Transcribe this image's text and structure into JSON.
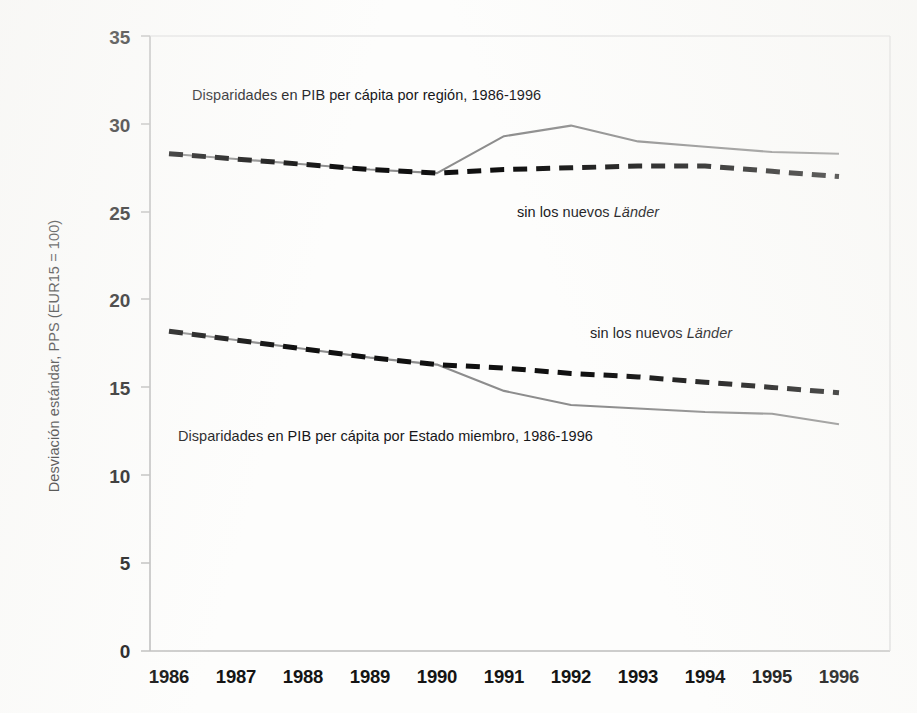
{
  "chart_data": {
    "type": "line",
    "title": "",
    "xlabel": "",
    "ylabel": "Desviación estándar, PPS (EUR15 = 100)",
    "x": [
      1986,
      1987,
      1988,
      1989,
      1990,
      1991,
      1992,
      1993,
      1994,
      1995,
      1996
    ],
    "xtick_labels": [
      "1986",
      "1987",
      "1988",
      "1989",
      "1990",
      "1991",
      "1992",
      "1993",
      "1994",
      "1995",
      "1996"
    ],
    "ytick_labels": [
      "0",
      "5",
      "10",
      "15",
      "20",
      "25",
      "30",
      "35"
    ],
    "yticks": [
      0,
      5,
      10,
      15,
      20,
      25,
      30,
      35
    ],
    "ylim": [
      0,
      35
    ],
    "xlim": [
      1986,
      1996
    ],
    "grid": false,
    "legend": "none (inline annotations)",
    "series": [
      {
        "name": "Disparidades en PIB per cápita por región, 1986-1996",
        "style": "solid",
        "color": "#8d8d8d",
        "values": [
          28.3,
          28.0,
          27.7,
          27.4,
          27.2,
          29.3,
          29.9,
          29.0,
          28.7,
          28.4,
          28.3
        ]
      },
      {
        "name": "Disparidades en PIB per cápita por región, sin los nuevos Länder",
        "style": "dashed",
        "color": "#101010",
        "values": [
          28.3,
          28.0,
          27.7,
          27.4,
          27.2,
          27.4,
          27.5,
          27.6,
          27.6,
          27.3,
          27.0
        ]
      },
      {
        "name": "Disparidades en PIB per cápita por Estado miembro, 1986-1996",
        "style": "solid",
        "color": "#8d8d8d",
        "values": [
          18.2,
          17.7,
          17.2,
          16.7,
          16.3,
          14.8,
          14.0,
          13.8,
          13.6,
          13.5,
          12.9
        ]
      },
      {
        "name": "Disparidades en PIB per cápita por Estado miembro, sin los nuevos Länder",
        "style": "dashed",
        "color": "#101010",
        "values": [
          18.2,
          17.7,
          17.2,
          16.7,
          16.3,
          16.1,
          15.8,
          15.6,
          15.3,
          15.0,
          14.7
        ]
      }
    ],
    "annotations": [
      {
        "id": "region-title",
        "text": "Disparidades en PIB per cápita  por región, 1986-1996"
      },
      {
        "id": "region-lander",
        "text_prefix": "sin los nuevos ",
        "text_italic": "Länder"
      },
      {
        "id": "member-lander",
        "text_prefix": "sin los nuevos ",
        "text_italic": "Länder"
      },
      {
        "id": "member-title",
        "text": "Disparidades en PIB per cápita por Estado miembro, 1986-1996"
      }
    ],
    "colors": {
      "solid_line": "#8d8d8d",
      "dashed_line": "#101010",
      "axis": "#b9b9b9",
      "text": "#141414",
      "background": "#fdfdfc"
    }
  },
  "axis": {
    "y_label": "Desviación estándar, PPS (EUR15 = 100)",
    "y_ticks": [
      "35",
      "30",
      "25",
      "20",
      "15",
      "10",
      "5",
      "0"
    ],
    "x_ticks": [
      "1986",
      "1987",
      "1988",
      "1989",
      "1990",
      "1991",
      "1992",
      "1993",
      "1994",
      "1995",
      "1996"
    ]
  },
  "annotations": {
    "region_title": "Disparidades en PIB per cápita  por región, 1986-1996",
    "region_lander_prefix": "sin los nuevos ",
    "region_lander_italic": "Länder",
    "member_lander_prefix": "sin los nuevos ",
    "member_lander_italic": "Länder",
    "member_title": "Disparidades en PIB per cápita por Estado miembro, 1986-1996"
  }
}
